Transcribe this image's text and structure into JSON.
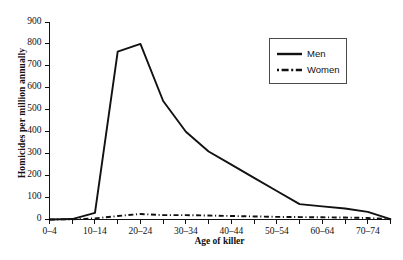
{
  "chart_data": {
    "type": "line",
    "title": "",
    "xlabel": "Age of killer",
    "ylabel": "Homicides per million annually",
    "ylim": [
      0,
      900
    ],
    "ytick_values": [
      0,
      100,
      200,
      300,
      400,
      500,
      600,
      700,
      800,
      900
    ],
    "ytick_labels": [
      "0",
      "100",
      "200",
      "300",
      "400",
      "500",
      "600",
      "700",
      "800",
      "900"
    ],
    "grid": false,
    "legend_position": "upper right",
    "categories": [
      "0–4",
      "5–9",
      "10–14",
      "15–19",
      "20–24",
      "25–29",
      "30–34",
      "35–39",
      "40–44",
      "45–49",
      "50–54",
      "55–59",
      "60–64",
      "65–69",
      "70–74",
      "75–79"
    ],
    "xtick_labels_shown": [
      "0–4",
      "10–14",
      "20–24",
      "30–34",
      "40–44",
      "50–54",
      "60–64",
      "70–74"
    ],
    "series": [
      {
        "name": "Men",
        "style": "solid",
        "color": "#111111",
        "values": [
          0,
          2,
          30,
          765,
          800,
          540,
          400,
          310,
          250,
          190,
          130,
          70,
          60,
          50,
          35,
          2
        ]
      },
      {
        "name": "Women",
        "style": "dash-dot",
        "color": "#111111",
        "values": [
          0,
          1,
          5,
          16,
          25,
          20,
          20,
          18,
          16,
          14,
          12,
          11,
          10,
          9,
          7,
          1
        ]
      }
    ]
  },
  "legend": {
    "entries": [
      {
        "label": "Men"
      },
      {
        "label": "Women"
      }
    ]
  }
}
